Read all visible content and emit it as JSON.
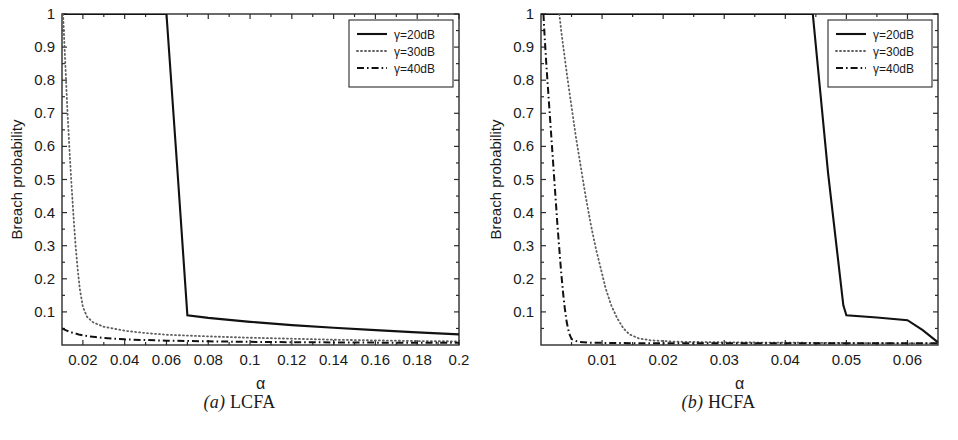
{
  "figure": {
    "panels": [
      {
        "caption_index": "(a)",
        "caption_text": "LCFA",
        "caption_full": "(a) LCFA"
      },
      {
        "caption_index": "(b)",
        "caption_text": "HCFA",
        "caption_full": "(b) HCFA"
      }
    ]
  },
  "chart_data": [
    {
      "type": "line",
      "title": "(a) LCFA",
      "xlabel": "α",
      "ylabel": "Breach probability",
      "xlim": [
        0.01,
        0.2
      ],
      "ylim": [
        0.0,
        1.0
      ],
      "xticks": [
        0.02,
        0.04,
        0.06,
        0.08,
        0.1,
        0.12,
        0.14,
        0.16,
        0.18,
        0.2
      ],
      "xtick_labels": [
        "0.02",
        "0.04",
        "0.06",
        "0.08",
        "0.1",
        "0.12",
        "0.14",
        "0.16",
        "0.18",
        "0.2"
      ],
      "yticks": [
        0.1,
        0.2,
        0.3,
        0.4,
        0.5,
        0.6,
        0.7,
        0.8,
        0.9,
        1
      ],
      "ytick_labels": [
        "0.1",
        "0.2",
        "0.3",
        "0.4",
        "0.5",
        "0.6",
        "0.7",
        "0.8",
        "0.9",
        "1"
      ],
      "grid": false,
      "legend_position": "top-right",
      "series": [
        {
          "name": "γ=20dB",
          "style": "solid",
          "x": [
            0.01,
            0.03,
            0.05,
            0.06,
            0.065,
            0.07,
            0.08,
            0.1,
            0.12,
            0.14,
            0.16,
            0.18,
            0.2
          ],
          "y": [
            1.0,
            1.0,
            1.0,
            1.0,
            0.55,
            0.09,
            0.082,
            0.07,
            0.06,
            0.052,
            0.045,
            0.038,
            0.032
          ]
        },
        {
          "name": "γ=30dB",
          "style": "dotted",
          "x": [
            0.0105,
            0.011,
            0.0118,
            0.0125,
            0.0135,
            0.0145,
            0.0155,
            0.0165,
            0.0175,
            0.0185,
            0.02,
            0.022,
            0.025,
            0.03,
            0.04,
            0.05,
            0.06,
            0.08,
            0.1,
            0.12,
            0.14,
            0.16,
            0.18,
            0.2
          ],
          "y": [
            1.0,
            0.93,
            0.82,
            0.72,
            0.6,
            0.49,
            0.39,
            0.3,
            0.23,
            0.17,
            0.115,
            0.085,
            0.068,
            0.055,
            0.043,
            0.036,
            0.031,
            0.026,
            0.022,
            0.019,
            0.016,
            0.014,
            0.012,
            0.011
          ]
        },
        {
          "name": "γ=40dB",
          "style": "dash-dot",
          "x": [
            0.01,
            0.012,
            0.015,
            0.018,
            0.022,
            0.026,
            0.03,
            0.04,
            0.05,
            0.06,
            0.08,
            0.1,
            0.12,
            0.14,
            0.16,
            0.18,
            0.2
          ],
          "y": [
            0.05,
            0.044,
            0.037,
            0.032,
            0.027,
            0.024,
            0.021,
            0.017,
            0.015,
            0.013,
            0.011,
            0.0095,
            0.0085,
            0.0078,
            0.0072,
            0.0068,
            0.0065
          ]
        }
      ],
      "legend": [
        {
          "label": "γ=20dB",
          "style": "solid"
        },
        {
          "label": "γ=30dB",
          "style": "dotted"
        },
        {
          "label": "γ=40dB",
          "style": "dash-dot"
        }
      ]
    },
    {
      "type": "line",
      "title": "(b) HCFA",
      "xlabel": "α",
      "ylabel": "Breach probability",
      "xlim": [
        0.0,
        0.065
      ],
      "ylim": [
        0.0,
        1.0
      ],
      "xticks": [
        0.01,
        0.02,
        0.03,
        0.04,
        0.05,
        0.06
      ],
      "xtick_labels": [
        "0.01",
        "0.02",
        "0.03",
        "0.04",
        "0.05",
        "0.06"
      ],
      "yticks": [
        0.1,
        0.2,
        0.3,
        0.4,
        0.5,
        0.6,
        0.7,
        0.8,
        0.9,
        1
      ],
      "ytick_labels": [
        "0.1",
        "0.2",
        "0.3",
        "0.4",
        "0.5",
        "0.6",
        "0.7",
        "0.8",
        "0.9",
        "1"
      ],
      "grid": false,
      "legend_position": "top-right",
      "series": [
        {
          "name": "γ=20dB",
          "style": "solid",
          "x": [
            0.0,
            0.01,
            0.02,
            0.03,
            0.04,
            0.0445,
            0.047,
            0.0495,
            0.05,
            0.055,
            0.06,
            0.0625,
            0.065
          ],
          "y": [
            1.0,
            1.0,
            1.0,
            1.0,
            1.0,
            1.0,
            0.52,
            0.12,
            0.09,
            0.083,
            0.075,
            0.045,
            0.008
          ]
        },
        {
          "name": "γ=30dB",
          "style": "dotted",
          "x": [
            0.003,
            0.0033,
            0.0038,
            0.0043,
            0.005,
            0.0057,
            0.0065,
            0.0073,
            0.0082,
            0.009,
            0.0098,
            0.0106,
            0.0115,
            0.0125,
            0.0135,
            0.0145,
            0.016,
            0.018,
            0.022,
            0.03,
            0.04,
            0.05,
            0.06,
            0.065
          ],
          "y": [
            1.0,
            0.95,
            0.88,
            0.81,
            0.72,
            0.63,
            0.54,
            0.45,
            0.36,
            0.29,
            0.23,
            0.17,
            0.12,
            0.08,
            0.05,
            0.032,
            0.02,
            0.014,
            0.01,
            0.008,
            0.007,
            0.006,
            0.005,
            0.005
          ]
        },
        {
          "name": "γ=40dB",
          "style": "dash-dot",
          "x": [
            0.0004,
            0.0006,
            0.0009,
            0.0012,
            0.0015,
            0.0018,
            0.0021,
            0.0024,
            0.0027,
            0.003,
            0.0033,
            0.0036,
            0.0039,
            0.0042,
            0.0046,
            0.005,
            0.006,
            0.008,
            0.012,
            0.02,
            0.03,
            0.04,
            0.05,
            0.06,
            0.065
          ],
          "y": [
            1.0,
            0.93,
            0.84,
            0.76,
            0.68,
            0.6,
            0.52,
            0.44,
            0.36,
            0.29,
            0.22,
            0.16,
            0.11,
            0.07,
            0.035,
            0.018,
            0.01,
            0.007,
            0.006,
            0.005,
            0.005,
            0.005,
            0.005,
            0.005,
            0.005
          ]
        }
      ],
      "legend": [
        {
          "label": "γ=20dB",
          "style": "solid"
        },
        {
          "label": "γ=30dB",
          "style": "dotted"
        },
        {
          "label": "γ=40dB",
          "style": "dash-dot"
        }
      ]
    }
  ]
}
